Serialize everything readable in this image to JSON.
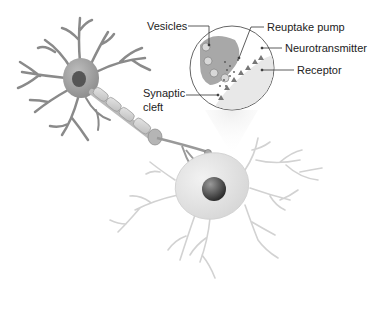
{
  "diagram": {
    "labels": {
      "vesicles": "Vesicles",
      "reuptake_pump": "Reuptake pump",
      "neurotransmitter": "Neurotransmitter",
      "receptor": "Receptor",
      "synaptic_cleft_line1": "Synaptic",
      "synaptic_cleft_line2": "cleft"
    },
    "colors": {
      "presynaptic_neuron": "#9a9a9a",
      "postsynaptic_neuron": "#e4e4e4",
      "nucleus": "#4a4a4a",
      "leader_line": "#333333",
      "text": "#222222"
    }
  }
}
